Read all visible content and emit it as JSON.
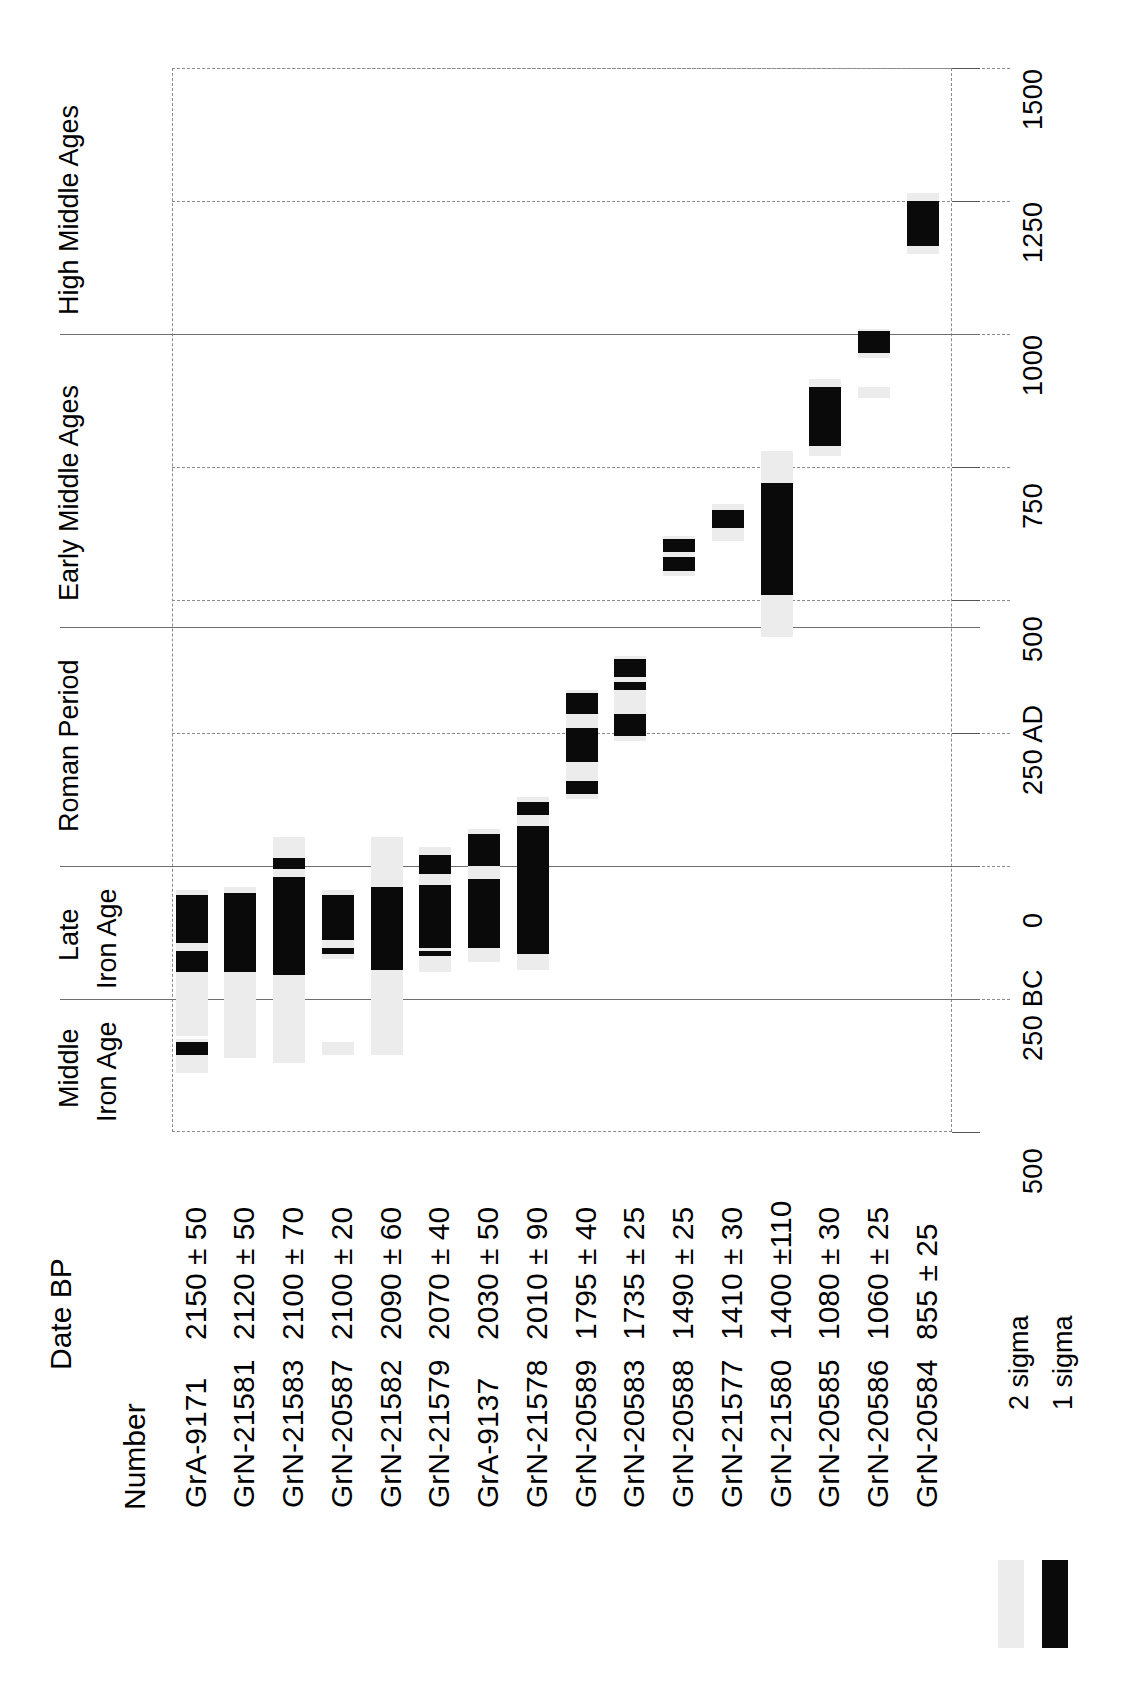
{
  "chart_data": {
    "type": "bar",
    "title": "",
    "xlabel": "",
    "ylabel": "",
    "orientation": "horizontal-ranges-rotated",
    "axis": {
      "name": "Calendar years",
      "min": -500,
      "max": 1500,
      "grid": true,
      "tick_values": [
        -500,
        -250,
        0,
        250,
        500,
        750,
        1000,
        1250,
        1500
      ],
      "tick_labels": [
        "500",
        "250 BC",
        "0",
        "250 AD",
        "500",
        "750",
        "1000",
        "1250",
        "1500"
      ]
    },
    "periods": [
      {
        "label": "Middle\nIron Age",
        "line1": "Middle",
        "line2": "Iron Age",
        "start": -500,
        "end": -250
      },
      {
        "label": "Late\nIron Age",
        "line1": "Late",
        "line2": "Iron Age",
        "start": -250,
        "end": 0
      },
      {
        "label": "Roman Period",
        "line1": "Roman Period",
        "line2": "",
        "start": 0,
        "end": 450
      },
      {
        "label": "Early Middle Ages",
        "line1": "Early Middle Ages",
        "line2": "",
        "start": 450,
        "end": 1000
      },
      {
        "label": "High Middle Ages",
        "line1": "High Middle Ages",
        "line2": "",
        "start": 1000,
        "end": 1500
      }
    ],
    "legend": {
      "position": "bottom-right",
      "entries": [
        {
          "label": "2 sigma",
          "color": "#ececec"
        },
        {
          "label": "1 sigma",
          "color": "#0a0a0a"
        }
      ]
    },
    "columns": [
      "Number",
      "Date BP"
    ],
    "samples": [
      {
        "number": "GrA-9171",
        "date_bp": "2150 ± 50",
        "sigma2": [
          [
            -390,
            -325
          ],
          [
            -320,
            -45
          ]
        ],
        "sigma1": [
          [
            -355,
            -330
          ],
          [
            -200,
            -160
          ],
          [
            -145,
            -55
          ]
        ]
      },
      {
        "number": "GrN-21581",
        "date_bp": "2120 ± 50",
        "sigma2": [
          [
            -360,
            -330
          ],
          [
            -355,
            -40
          ]
        ],
        "sigma1": [
          [
            -200,
            -50
          ]
        ]
      },
      {
        "number": "GrN-21583",
        "date_bp": "2100 ± 70",
        "sigma2": [
          [
            -370,
            -330
          ],
          [
            -360,
            55
          ]
        ],
        "sigma1": [
          [
            -205,
            -20
          ],
          [
            -5,
            15
          ]
        ]
      },
      {
        "number": "GrN-20587",
        "date_bp": "2100 ± 20",
        "sigma2": [
          [
            -355,
            -330
          ],
          [
            -175,
            -45
          ]
        ],
        "sigma1": [
          [
            -165,
            -155
          ],
          [
            -140,
            -55
          ]
        ]
      },
      {
        "number": "GrN-21582",
        "date_bp": "2090 ± 60",
        "sigma2": [
          [
            -355,
            -330
          ],
          [
            -345,
            55
          ]
        ],
        "sigma1": [
          [
            -195,
            -40
          ]
        ]
      },
      {
        "number": "GrN-21579",
        "date_bp": "2070 ± 40",
        "sigma2": [
          [
            -200,
            35
          ]
        ],
        "sigma1": [
          [
            -170,
            -160
          ],
          [
            -155,
            -35
          ],
          [
            -15,
            20
          ]
        ]
      },
      {
        "number": "GrA-9137",
        "date_bp": "2030 ± 50",
        "sigma2": [
          [
            -180,
            70
          ]
        ],
        "sigma1": [
          [
            -155,
            -25
          ],
          [
            0,
            60
          ]
        ]
      },
      {
        "number": "GrN-21578",
        "date_bp": "2010 ± 90",
        "sigma2": [
          [
            -195,
            130
          ]
        ],
        "sigma1": [
          [
            -165,
            75
          ],
          [
            95,
            120
          ]
        ]
      },
      {
        "number": "GrN-20589",
        "date_bp": "1795 ± 40",
        "sigma2": [
          [
            125,
            330
          ]
        ],
        "sigma1": [
          [
            135,
            160
          ],
          [
            195,
            260
          ],
          [
            285,
            325
          ]
        ]
      },
      {
        "number": "GrN-20583",
        "date_bp": "1735 ± 25",
        "sigma2": [
          [
            235,
            395
          ]
        ],
        "sigma1": [
          [
            245,
            285
          ],
          [
            330,
            345
          ],
          [
            355,
            390
          ]
        ]
      },
      {
        "number": "GrN-20588",
        "date_bp": "1490 ± 25",
        "sigma2": [
          [
            545,
            620
          ]
        ],
        "sigma1": [
          [
            555,
            580
          ],
          [
            590,
            615
          ]
        ]
      },
      {
        "number": "GrN-21577",
        "date_bp": "1410 ± 30",
        "sigma2": [
          [
            610,
            680
          ]
        ],
        "sigma1": [
          [
            635,
            670
          ]
        ]
      },
      {
        "number": "GrN-21580",
        "date_bp": "1400 ±110",
        "sigma2": [
          [
            430,
            780
          ]
        ],
        "sigma1": [
          [
            510,
            720
          ]
        ]
      },
      {
        "number": "GrN-20585",
        "date_bp": "1080 ± 30",
        "sigma2": [
          [
            770,
            915
          ],
          [
            890,
            905
          ]
        ],
        "sigma1": [
          [
            790,
            900
          ],
          [
            895,
            900
          ]
        ]
      },
      {
        "number": "GrN-20586",
        "date_bp": "1060 ± 25",
        "sigma2": [
          [
            880,
            900
          ],
          [
            955,
            1010
          ]
        ],
        "sigma1": [
          [
            965,
            1005
          ]
        ]
      },
      {
        "number": "GrN-20584",
        "date_bp": "855 ± 25",
        "sigma2": [
          [
            1150,
            1265
          ]
        ],
        "sigma1": [
          [
            1165,
            1250
          ]
        ]
      }
    ]
  }
}
